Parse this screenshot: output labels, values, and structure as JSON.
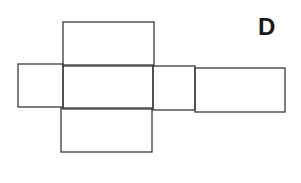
{
  "figure": {
    "label": "D",
    "stroke_color": "#3a3a3a",
    "background": "#ffffff"
  },
  "faces": [
    {
      "name": "top-face",
      "x": 63,
      "y": 22,
      "w": 91,
      "h": 44
    },
    {
      "name": "left-face",
      "x": 18,
      "y": 64,
      "w": 45,
      "h": 43
    },
    {
      "name": "front-face",
      "x": 63,
      "y": 65,
      "w": 90,
      "h": 44
    },
    {
      "name": "right-face",
      "x": 153,
      "y": 66,
      "w": 42,
      "h": 44
    },
    {
      "name": "back-face",
      "x": 195,
      "y": 68,
      "w": 90,
      "h": 44
    },
    {
      "name": "bottom-face",
      "x": 61,
      "y": 108,
      "w": 91,
      "h": 44
    }
  ]
}
